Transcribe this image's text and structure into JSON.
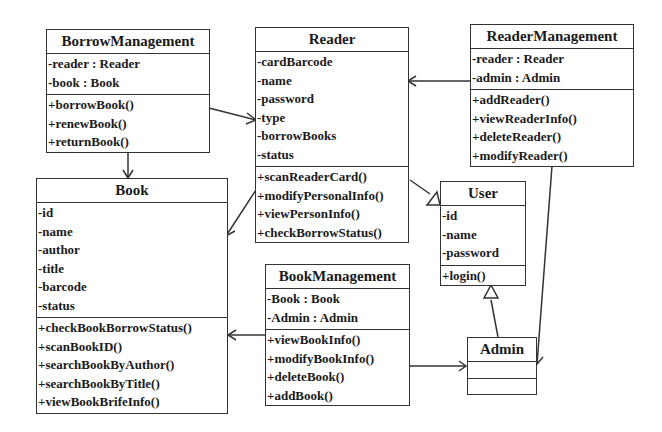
{
  "classes": {
    "borrow_management": {
      "name": "BorrowManagement",
      "attributes": [
        "-reader : Reader",
        "-book : Book"
      ],
      "methods": [
        "+borrowBook()",
        "+renewBook()",
        "+returnBook()"
      ]
    },
    "reader": {
      "name": "Reader",
      "attributes": [
        "-cardBarcode",
        "-name",
        "-password",
        "-type",
        "-borrowBooks",
        "-status"
      ],
      "methods": [
        "+scanReaderCard()",
        "+modifyPersonalInfo()",
        "+viewPersonInfo()",
        "+checkBorrowStatus()"
      ]
    },
    "reader_management": {
      "name": "ReaderManagement",
      "attributes": [
        "-reader : Reader",
        "-admin : Admin"
      ],
      "methods": [
        "+addReader()",
        "+viewReaderInfo()",
        "+deleteReader()",
        "+modifyReader()"
      ]
    },
    "book": {
      "name": "Book",
      "attributes": [
        "-id",
        "-name",
        "-author",
        "-title",
        "-barcode",
        "-status"
      ],
      "methods": [
        "+checkBookBorrowStatus()",
        "+scanBookID()",
        "+searchBookByAuthor()",
        "+searchBookByTitle()",
        "+viewBookBrifeInfo()"
      ]
    },
    "user": {
      "name": "User",
      "attributes": [
        "-id",
        "-name",
        "-password"
      ],
      "methods": [
        "+login()"
      ]
    },
    "book_management": {
      "name": "BookManagement",
      "attributes": [
        "-Book : Book",
        "-Admin : Admin"
      ],
      "methods": [
        "+viewBookInfo()",
        "+modifyBookInfo()",
        "+deleteBook()",
        "+addBook()"
      ]
    },
    "admin": {
      "name": "Admin",
      "attributes": [],
      "methods": []
    }
  },
  "relationships": [
    {
      "from": "BorrowManagement",
      "to": "Reader",
      "type": "association"
    },
    {
      "from": "BorrowManagement",
      "to": "Book",
      "type": "association"
    },
    {
      "from": "ReaderManagement",
      "to": "Reader",
      "type": "association"
    },
    {
      "from": "ReaderManagement",
      "to": "Admin",
      "type": "association"
    },
    {
      "from": "Reader",
      "to": "Book",
      "type": "association"
    },
    {
      "from": "Reader",
      "to": "User",
      "type": "generalization"
    },
    {
      "from": "Admin",
      "to": "User",
      "type": "generalization"
    },
    {
      "from": "BookManagement",
      "to": "Book",
      "type": "association"
    },
    {
      "from": "BookManagement",
      "to": "Admin",
      "type": "association"
    }
  ]
}
